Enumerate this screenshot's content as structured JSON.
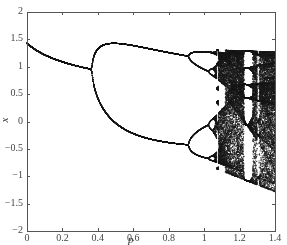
{
  "chart_data": {
    "type": "scatter",
    "title": "",
    "xlabel": "p",
    "ylabel": "x",
    "xlim": [
      0,
      1.4
    ],
    "ylim": [
      -2,
      2
    ],
    "grid": false,
    "legend": null,
    "x_ticks": [
      0,
      0.2,
      0.4,
      0.6,
      0.8,
      1,
      1.2,
      1.4
    ],
    "x_tick_labels": [
      "0",
      "0.2",
      "0.4",
      "0.6",
      "0.8",
      "1",
      "1.2",
      "1.4"
    ],
    "y_ticks": [
      2,
      1.5,
      1,
      0.5,
      0,
      -0.5,
      -1,
      -1.5,
      -2
    ],
    "y_tick_labels": [
      "2",
      "1.5",
      "1",
      "0.5",
      "0",
      "−0.5",
      "−1",
      "−1.5",
      "−2"
    ],
    "series": [
      {
        "name": "attractor",
        "params": {
          "b": 0.3,
          "p_start": 0,
          "p_end": 1.4
        }
      }
    ],
    "key_points": [
      {
        "p": 0,
        "x": 0
      },
      {
        "p": 0.37,
        "x": 0.37
      },
      {
        "p": 0.91,
        "x_upper": 1.1,
        "x_lower": -0.35
      },
      {
        "p": 1.4,
        "x_max": 1.8,
        "x_min": -1.85
      }
    ]
  },
  "plot": {
    "left": 27,
    "right": 275,
    "top": 12,
    "bottom": 231,
    "point_color": "#1a1a1a",
    "axis_color": "#555555"
  }
}
